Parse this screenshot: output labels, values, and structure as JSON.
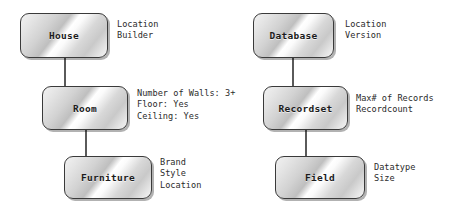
{
  "diagram": {
    "groups": [
      {
        "name": "house-hierarchy",
        "nodes": [
          {
            "id": "house",
            "label": "House",
            "attributes": [
              "Location",
              "Builder"
            ]
          },
          {
            "id": "room",
            "label": "Room",
            "attributes": [
              "Number of Walls: 3+",
              "Floor: Yes",
              "Ceiling: Yes"
            ]
          },
          {
            "id": "furniture",
            "label": "Furniture",
            "attributes": [
              "Brand",
              "Style",
              "Location"
            ]
          }
        ],
        "links": [
          {
            "from": "house",
            "to": "room"
          },
          {
            "from": "room",
            "to": "furniture"
          }
        ]
      },
      {
        "name": "database-hierarchy",
        "nodes": [
          {
            "id": "database",
            "label": "Database",
            "attributes": [
              "Location",
              "Version"
            ]
          },
          {
            "id": "recordset",
            "label": "Recordset",
            "attributes": [
              "Max# of Records",
              "Recordcount"
            ]
          },
          {
            "id": "field",
            "label": "Field",
            "attributes": [
              "Datatype",
              "Size"
            ]
          }
        ],
        "links": [
          {
            "from": "database",
            "to": "recordset"
          },
          {
            "from": "recordset",
            "to": "field"
          }
        ]
      }
    ],
    "colors": {
      "background": "#ffffff",
      "box_border": "#3a3a3a",
      "box_fill_light": "#ffffff",
      "box_fill_dark": "#bfbfbf",
      "connector": "#5a5a5a",
      "label_text": "#1b1b1b",
      "attribute_text": "#2b2b2b",
      "shadow": "#000000"
    }
  }
}
